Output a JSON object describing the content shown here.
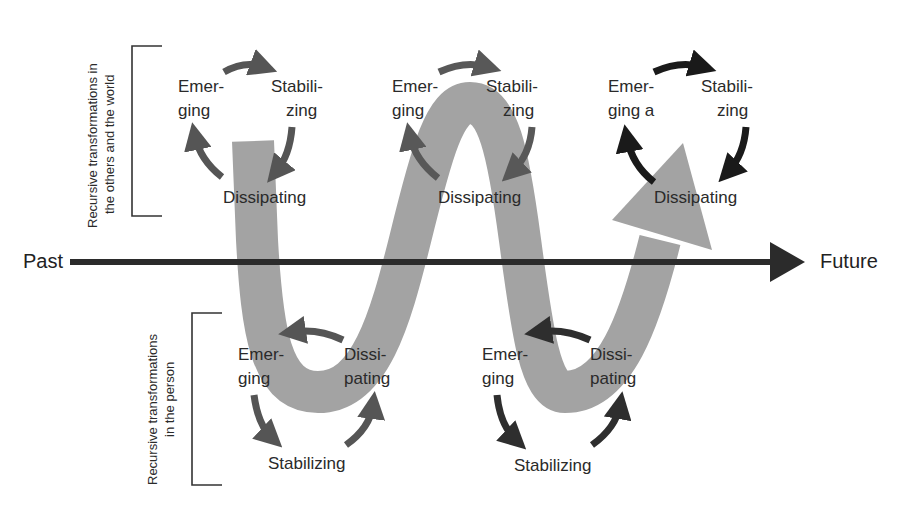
{
  "diagram": {
    "timeline": {
      "start_label": "Past",
      "end_label": "Future",
      "color": "#2b2b2b"
    },
    "band": {
      "color": "#a3a3a3",
      "description": "wave-shaped band oscillating between the two levels, ending in an arrowhead"
    },
    "side_labels": {
      "top": {
        "line1": "Recursive transformations in",
        "line2": "the others and the world"
      },
      "bottom": {
        "line1": "Recursive transformations",
        "line2": "in the person"
      }
    },
    "top_cycles": [
      {
        "emerging_1": "Emer-",
        "emerging_2": "ging",
        "stabilizing_1": "Stabili-",
        "stabilizing_2": "zing",
        "dissipating": "Dissipating",
        "arrow_color": "#555555"
      },
      {
        "emerging_1": "Emer-",
        "emerging_2": "ging",
        "stabilizing_1": "Stabili-",
        "stabilizing_2": "zing",
        "dissipating": "Dissipating",
        "arrow_color": "#585858"
      },
      {
        "emerging_1": "Emer-",
        "emerging_2": "ging a",
        "stabilizing_1": "Stabili-",
        "stabilizing_2": "zing",
        "dissipating": "Dissipating",
        "arrow_color": "#1a1a1a"
      }
    ],
    "bottom_cycles": [
      {
        "emerging_1": "Emer-",
        "emerging_2": "ging",
        "dissipating_1": "Dissi-",
        "dissipating_2": "pating",
        "stabilizing": "Stabilizing",
        "arrow_color": "#555555"
      },
      {
        "emerging_1": "Emer-",
        "emerging_2": "ging",
        "dissipating_1": "Dissi-",
        "dissipating_2": "pating",
        "stabilizing": "Stabilizing",
        "arrow_color": "#2e2e2e"
      }
    ]
  }
}
